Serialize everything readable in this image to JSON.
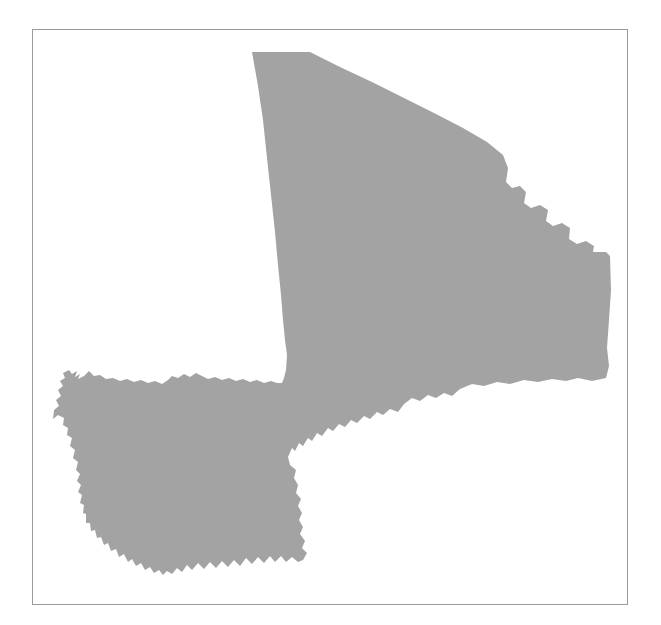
{
  "page": {
    "type": "map-silhouette",
    "background_color": "#ffffff",
    "width": 661,
    "height": 625
  },
  "frame": {
    "name": "map-border-frame",
    "border_color": "#9a9a9a",
    "border_width": 1,
    "x": 32,
    "y": 29,
    "width": 596,
    "height": 576,
    "fill": "#ffffff"
  },
  "map": {
    "subject": "Mali",
    "region_type": "country-outline",
    "fill_color": "#a3a3a3",
    "stroke_color": "none",
    "label": "",
    "legend": [],
    "annotations": [],
    "bounds": {
      "min_x": 53,
      "min_y": 52,
      "max_x": 612,
      "max_y": 575
    },
    "outline_path": "M252,52 L310,52 L340,67 L372,82 L404,98 L436,114 L463,128 L487,142 L503,155 L508,168 L506,182 L512,188 L520,186 L526,192 L524,203 L531,208 L540,205 L548,210 L546,221 L553,226 L562,223 L570,228 L569,239 L577,244 L586,241 L594,246 L593,252 L606,252 L610,256 L611,290 L609,320 L607,348 L609,366 L606,378 L592,381 L578,378 L566,381 L552,379 L538,382 L524,380 L510,384 L497,382 L484,386 L472,384 L460,389 L452,396 L444,393 L436,398 L428,395 L420,401 L412,398 L404,404 L398,412 L390,409 L383,415 L377,412 L370,419 L364,416 L357,423 L351,420 L345,427 L339,424 L333,431 L328,428 L322,436 L317,433 L312,441 L308,438 L303,446 L299,443 L295,451 L292,448 L288,457 L290,465 L296,470 L294,478 L298,485 L296,493 L301,499 L298,506 L302,513 L299,520 L303,527 L300,534 L305,541 L302,548 L307,553 L303,560 L298,562 L292,557 L286,562 L281,556 L275,562 L270,556 L264,563 L258,557 L252,564 L246,558 L240,566 L234,560 L228,567 L222,561 L216,568 L210,562 L204,569 L198,563 L192,570 L187,565 L182,572 L177,568 L172,574 L167,571 L163,575 L159,570 L154,573 L150,567 L145,570 L141,563 L136,566 L132,559 L128,562 L124,554 L119,557 L116,549 L111,551 L108,543 L104,545 L101,537 L97,538 L95,530 L91,531 L90,523 L86,523 L86,514 L83,513 L84,505 L80,503 L82,495 L78,492 L81,485 L77,481 L80,474 L76,470 L78,462 L73,458 L75,450 L70,446 L72,438 L67,435 L68,428 L63,425 L64,418 L58,415 L53,419 L54,410 L59,406 L56,400 L61,396 L58,390 L63,386 L60,381 L65,378 L63,373 L69,370 L72,374 L77,371 L75,377 L80,374 L78,379 L84,376 L89,371 L94,376 L100,375 L106,379 L113,378 L120,381 L127,379 L134,382 L141,380 L148,383 L155,381 L162,384 L168,380 L172,376 L178,378 L184,374 L190,377 L196,373 L202,376 L208,379 L215,377 L222,380 L229,378 L236,381 L243,379 L250,382 L257,380 L264,383 L271,381 L277,383 L282,383 L284,378 L286,370 L287,355 L285,340 L283,320 L281,295 L278,265 L275,232 L271,195 L267,158 L263,120 L258,86 Z"
  }
}
